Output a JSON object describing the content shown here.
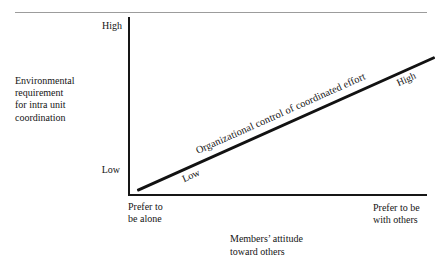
{
  "figure": {
    "y_axis": {
      "label_lines": [
        "Environmental",
        "requirement",
        "for intra unit",
        "coordination"
      ],
      "top_tick_label": "High",
      "bottom_tick_label": "Low"
    },
    "x_axis": {
      "title_lines": [
        "Members’ attitude",
        "toward others"
      ],
      "left_tick_label_lines": [
        "Prefer to",
        "be alone"
      ],
      "right_tick_label_lines": [
        "Prefer to be",
        "with others"
      ]
    },
    "trend_line": {
      "label": "Organizational control of coordinated effort",
      "start_label": "Low",
      "end_label": "High"
    }
  },
  "colors": {
    "background": "#ffffff",
    "axis": "#161616",
    "trend_line": "#121212",
    "top_rule": "#9c9c9c",
    "text": "#151515"
  },
  "chart_data": {
    "type": "line",
    "title": "",
    "xlabel": "Members’ attitude toward others",
    "ylabel": "Environmental requirement for intra unit coordination",
    "x_tick_labels": [
      "Prefer to be alone",
      "Prefer to be with others"
    ],
    "y_tick_labels": [
      "Low",
      "High"
    ],
    "x_range": [
      0,
      1
    ],
    "y_range": [
      0,
      1
    ],
    "grid": false,
    "legend_position": "none",
    "series": [
      {
        "name": "Organizational control of coordinated effort",
        "x": [
          0,
          1
        ],
        "values": [
          0,
          1
        ],
        "endpoint_labels": [
          "Low",
          "High"
        ],
        "style": "solid",
        "color": "#121212"
      }
    ],
    "annotations": [
      "Label 'Organizational control of coordinated effort' printed along and above the rising line",
      "'Low' printed below the line near its lower-left end, 'High' below the line near its upper-right end"
    ]
  }
}
